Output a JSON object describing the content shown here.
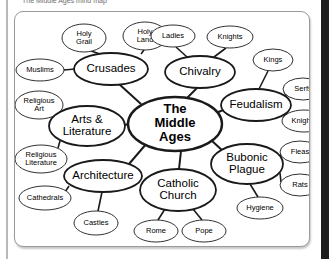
{
  "caption": {
    "text": "Respond to the smaller circle ( upper / perimeter )"
  },
  "diagram": {
    "title": "The Middle Ages mind map",
    "center": {
      "id": "center",
      "lines": [
        "The",
        "Middle",
        "Ages"
      ],
      "cx": 160,
      "cy": 112,
      "rx": 47,
      "ry": 27,
      "stroke_width": 2.4
    },
    "branches": [
      {
        "id": "crusades",
        "label": "Crusades",
        "cx": 96,
        "cy": 57,
        "rx": 37,
        "ry": 16,
        "stroke_width": 1.8,
        "leaves": [
          {
            "id": "holy-grail",
            "label": "Holy Grail",
            "lines": [
              "Holy",
              "Grail"
            ],
            "cx": 69,
            "cy": 26,
            "rx": 22,
            "ry": 14
          },
          {
            "id": "holy-land",
            "label": "Holy Land",
            "lines": [
              "Holy",
              "Land"
            ],
            "cx": 130,
            "cy": 24,
            "rx": 22,
            "ry": 14
          },
          {
            "id": "muslims",
            "label": "Muslims",
            "lines": [
              "Muslims"
            ],
            "cx": 25,
            "cy": 58,
            "rx": 24,
            "ry": 11
          }
        ]
      },
      {
        "id": "chivalry",
        "label": "Chivalry",
        "cx": 185,
        "cy": 60,
        "rx": 35,
        "ry": 16,
        "stroke_width": 1.8,
        "leaves": [
          {
            "id": "ladies",
            "label": "Ladies",
            "lines": [
              "Ladies"
            ],
            "cx": 158,
            "cy": 24,
            "rx": 22,
            "ry": 11
          },
          {
            "id": "knights-chivalry",
            "label": "Knights",
            "lines": [
              "Knights"
            ],
            "cx": 215,
            "cy": 25,
            "rx": 23,
            "ry": 11
          }
        ]
      },
      {
        "id": "feudalism",
        "label": "Feudalism",
        "cx": 241,
        "cy": 93,
        "rx": 35,
        "ry": 16,
        "stroke_width": 1.8,
        "leaves": [
          {
            "id": "kings",
            "label": "Kings",
            "lines": [
              "Kings"
            ],
            "cx": 258,
            "cy": 48,
            "rx": 20,
            "ry": 11
          },
          {
            "id": "serfs",
            "label": "Serfs",
            "lines": [
              "Serfs"
            ],
            "cx": 288,
            "cy": 77,
            "rx": 20,
            "ry": 11
          },
          {
            "id": "knights-feudalism",
            "label": "Knights",
            "lines": [
              "Knights"
            ],
            "cx": 289,
            "cy": 109,
            "rx": 22,
            "ry": 11
          }
        ]
      },
      {
        "id": "bubonic-plague",
        "label": "Bubonic Plague",
        "lines": [
          "Bubonic",
          "Plague"
        ],
        "cx": 232,
        "cy": 152,
        "rx": 36,
        "ry": 20,
        "stroke_width": 1.8,
        "leaves": [
          {
            "id": "fleas",
            "label": "Fleas",
            "lines": [
              "Fleas"
            ],
            "cx": 285,
            "cy": 140,
            "rx": 20,
            "ry": 11
          },
          {
            "id": "rats",
            "label": "Rats",
            "lines": [
              "Rats"
            ],
            "cx": 285,
            "cy": 173,
            "rx": 20,
            "ry": 11
          },
          {
            "id": "hygiene",
            "label": "Hygiene",
            "lines": [
              "Hygiene"
            ],
            "cx": 245,
            "cy": 196,
            "rx": 23,
            "ry": 11
          }
        ]
      },
      {
        "id": "catholic-church",
        "label": "Catholic Church",
        "lines": [
          "Catholic",
          "Church"
        ],
        "cx": 163,
        "cy": 178,
        "rx": 38,
        "ry": 21,
        "stroke_width": 1.8,
        "leaves": [
          {
            "id": "rome",
            "label": "Rome",
            "lines": [
              "Rome"
            ],
            "cx": 141,
            "cy": 219,
            "rx": 22,
            "ry": 11
          },
          {
            "id": "pope",
            "label": "Pope",
            "lines": [
              "Pope"
            ],
            "cx": 189,
            "cy": 219,
            "rx": 22,
            "ry": 11
          }
        ]
      },
      {
        "id": "architecture",
        "label": "Architecture",
        "cx": 88,
        "cy": 164,
        "rx": 39,
        "ry": 16,
        "stroke_width": 1.8,
        "leaves": [
          {
            "id": "cathedrals",
            "label": "Cathedrals",
            "lines": [
              "Cathedrals"
            ],
            "cx": 30,
            "cy": 186,
            "rx": 26,
            "ry": 12
          },
          {
            "id": "castles",
            "label": "Castles",
            "lines": [
              "Castles"
            ],
            "cx": 81,
            "cy": 211,
            "rx": 22,
            "ry": 12
          }
        ]
      },
      {
        "id": "arts-literature",
        "label": "Arts & Literature",
        "lines": [
          "Arts &",
          "Literature"
        ],
        "cx": 72,
        "cy": 114,
        "rx": 38,
        "ry": 20,
        "stroke_width": 1.8,
        "leaves": [
          {
            "id": "religious-art",
            "label": "Religious Art",
            "lines": [
              "Religious",
              "Art"
            ],
            "cx": 24,
            "cy": 93,
            "rx": 24,
            "ry": 14
          },
          {
            "id": "religious-literature",
            "label": "Religious Literature",
            "lines": [
              "Religious",
              "Literature"
            ],
            "cx": 26,
            "cy": 147,
            "rx": 26,
            "ry": 14
          }
        ]
      }
    ],
    "spokes": [
      {
        "id": "spoke-crusades",
        "x1": 126,
        "y1": 92,
        "x2": 104,
        "y2": 72
      },
      {
        "id": "spoke-chivalry",
        "x1": 172,
        "y1": 86,
        "x2": 182,
        "y2": 76
      },
      {
        "id": "spoke-feudalism",
        "x1": 201,
        "y1": 101,
        "x2": 213,
        "y2": 96
      },
      {
        "id": "spoke-bubonic",
        "x1": 196,
        "y1": 128,
        "x2": 209,
        "y2": 140
      },
      {
        "id": "spoke-catholic",
        "x1": 166,
        "y1": 139,
        "x2": 164,
        "y2": 157
      },
      {
        "id": "spoke-architecture",
        "x1": 132,
        "y1": 131,
        "x2": 114,
        "y2": 152
      },
      {
        "id": "spoke-arts",
        "x1": 113,
        "y1": 112,
        "x2": 110,
        "y2": 113
      }
    ],
    "links": [
      {
        "id": "link-crusades-holy-grail",
        "x1": 88,
        "y1": 43,
        "x2": 76,
        "y2": 39
      },
      {
        "id": "link-crusades-holy-land",
        "x1": 126,
        "y1": 42,
        "x2": 129,
        "y2": 38
      },
      {
        "id": "link-crusades-muslims",
        "x1": 60,
        "y1": 57,
        "x2": 49,
        "y2": 58
      },
      {
        "id": "link-chivalry-ladies",
        "x1": 172,
        "y1": 45,
        "x2": 161,
        "y2": 35
      },
      {
        "id": "link-chivalry-knights",
        "x1": 199,
        "y1": 45,
        "x2": 211,
        "y2": 36
      },
      {
        "id": "link-feudalism-kings",
        "x1": 244,
        "y1": 77,
        "x2": 253,
        "y2": 59
      },
      {
        "id": "link-feudalism-serfs",
        "x1": 272,
        "y1": 86,
        "x2": 269,
        "y2": 79
      },
      {
        "id": "link-feudalism-knights",
        "x1": 272,
        "y1": 101,
        "x2": 268,
        "y2": 106
      },
      {
        "id": "link-bubonic-fleas",
        "x1": 265,
        "y1": 145,
        "x2": 266,
        "y2": 142
      },
      {
        "id": "link-bubonic-rats",
        "x1": 265,
        "y1": 161,
        "x2": 266,
        "y2": 170
      },
      {
        "id": "link-bubonic-hygiene",
        "x1": 235,
        "y1": 172,
        "x2": 243,
        "y2": 185
      },
      {
        "id": "link-catholic-rome",
        "x1": 150,
        "y1": 197,
        "x2": 143,
        "y2": 208
      },
      {
        "id": "link-catholic-pope",
        "x1": 178,
        "y1": 197,
        "x2": 187,
        "y2": 208
      },
      {
        "id": "link-architecture-cathedrals",
        "x1": 54,
        "y1": 174,
        "x2": 50,
        "y2": 180
      },
      {
        "id": "link-architecture-castles",
        "x1": 87,
        "y1": 180,
        "x2": 83,
        "y2": 199
      },
      {
        "id": "link-arts-religious-art",
        "x1": 44,
        "y1": 101,
        "x2": 42,
        "y2": 100
      },
      {
        "id": "link-arts-religious-literature",
        "x1": 45,
        "y1": 129,
        "x2": 43,
        "y2": 136
      }
    ]
  }
}
